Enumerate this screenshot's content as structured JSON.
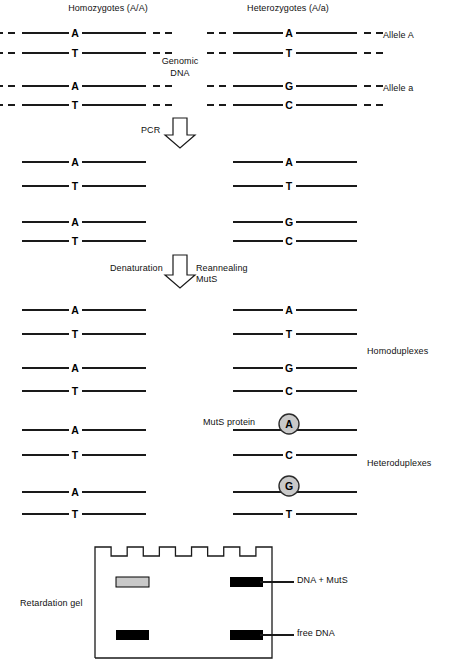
{
  "figure": {
    "title_left": "Homozygotes (A/A)",
    "title_right": "Heterozygotes (A/a)",
    "genomic_label_line1": "Genomic",
    "genomic_label_line2": "DNA",
    "allele_a_upper": "Allele  A",
    "allele_a_lower": "Allele  a",
    "step1_label": "PCR",
    "step2_label_left": "Denaturation",
    "step2_label_right_line1": "Reannealing",
    "step2_label_right_line2": "MutS",
    "homoduplexes_label": "Homoduplexes",
    "heteroduplexes_label": "Heteroduplexes",
    "muts_protein_label": "MutS protein",
    "retardation_gel_label": "Retardation gel",
    "gel_label_top": "DNA + MutS",
    "gel_label_bottom": "free DNA"
  },
  "colors": {
    "line": "#1a1a1a",
    "base_text": "#000000",
    "protein_fill": "#c9c9c9",
    "protein_stroke": "#2b2b2b",
    "band_black": "#000000",
    "band_gray": "#c9c9c9",
    "gel_stroke": "#1a1a1a"
  },
  "genomic_section": {
    "strands": [
      {
        "column": "left",
        "base": "A",
        "y": 33
      },
      {
        "column": "left",
        "base": "T",
        "y": 53
      },
      {
        "column": "left",
        "base": "A",
        "y": 86
      },
      {
        "column": "left",
        "base": "T",
        "y": 105
      },
      {
        "column": "right",
        "base": "A",
        "y": 33
      },
      {
        "column": "right",
        "base": "T",
        "y": 53
      },
      {
        "column": "right",
        "base": "G",
        "y": 86
      },
      {
        "column": "right",
        "base": "C",
        "y": 105
      }
    ]
  },
  "pcr_section": {
    "strands": [
      {
        "column": "left",
        "base": "A",
        "y": 162
      },
      {
        "column": "left",
        "base": "T",
        "y": 186
      },
      {
        "column": "left",
        "base": "A",
        "y": 222
      },
      {
        "column": "left",
        "base": "T",
        "y": 241
      },
      {
        "column": "right",
        "base": "A",
        "y": 162
      },
      {
        "column": "right",
        "base": "T",
        "y": 186
      },
      {
        "column": "right",
        "base": "G",
        "y": 222
      },
      {
        "column": "right",
        "base": "C",
        "y": 241
      }
    ]
  },
  "duplex_section": {
    "strands": [
      {
        "column": "left",
        "base": "A",
        "y": 310,
        "protein": false
      },
      {
        "column": "left",
        "base": "T",
        "y": 334,
        "protein": false
      },
      {
        "column": "left",
        "base": "A",
        "y": 368,
        "protein": false
      },
      {
        "column": "left",
        "base": "T",
        "y": 391,
        "protein": false
      },
      {
        "column": "left",
        "base": "A",
        "y": 430,
        "protein": false
      },
      {
        "column": "left",
        "base": "T",
        "y": 455,
        "protein": false
      },
      {
        "column": "left",
        "base": "A",
        "y": 492,
        "protein": false
      },
      {
        "column": "left",
        "base": "T",
        "y": 514,
        "protein": false
      },
      {
        "column": "right",
        "base": "A",
        "y": 310,
        "protein": false
      },
      {
        "column": "right",
        "base": "T",
        "y": 334,
        "protein": false
      },
      {
        "column": "right",
        "base": "G",
        "y": 368,
        "protein": false
      },
      {
        "column": "right",
        "base": "C",
        "y": 391,
        "protein": false
      },
      {
        "column": "right",
        "base": "A",
        "y": 430,
        "protein": true
      },
      {
        "column": "right",
        "base": "C",
        "y": 455,
        "protein": false
      },
      {
        "column": "right",
        "base": "G",
        "y": 492,
        "protein": true
      },
      {
        "column": "right",
        "base": "T",
        "y": 514,
        "protein": false
      }
    ]
  },
  "gel": {
    "wells": 5,
    "bands": [
      {
        "lane": "left",
        "row": "top",
        "style": "gray",
        "x": 116,
        "y": 577,
        "w": 33,
        "h": 10
      },
      {
        "lane": "right",
        "row": "top",
        "style": "black",
        "x": 230,
        "y": 577,
        "w": 33,
        "h": 10
      },
      {
        "lane": "left",
        "row": "bottom",
        "style": "black",
        "x": 116,
        "y": 630,
        "w": 33,
        "h": 10
      },
      {
        "lane": "right",
        "row": "bottom",
        "style": "black",
        "x": 230,
        "y": 630,
        "w": 33,
        "h": 10
      }
    ]
  }
}
